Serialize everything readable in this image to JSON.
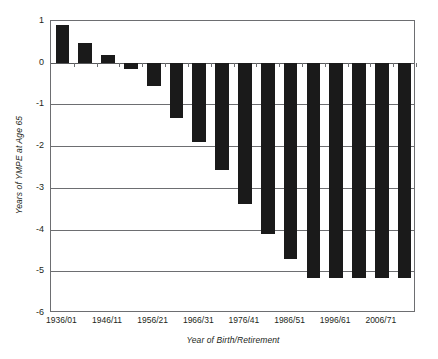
{
  "chart_data": {
    "type": "bar",
    "title": "",
    "xlabel": "Year of Birth/Retirement",
    "ylabel": "Years of YMPE at Age 65",
    "ylim": [
      -6,
      1
    ],
    "yticks": [
      1,
      0,
      -1,
      -2,
      -3,
      -4,
      -5,
      -6
    ],
    "ytick_labels": [
      "1",
      "0",
      "-1",
      "-2",
      "-3",
      "-4",
      "-5",
      "-6"
    ],
    "grid": true,
    "legend": "none",
    "xtick_labels": [
      "1936/01",
      "1946/11",
      "1956/21",
      "1966/31",
      "1976/41",
      "1986/51",
      "1996/61",
      "2006/71"
    ],
    "categories": [
      "1936/01",
      "1941/06",
      "1946/11",
      "1951/16",
      "1956/21",
      "1961/26",
      "1966/31",
      "1971/36",
      "1976/41",
      "1981/46",
      "1986/51",
      "1991/56",
      "1996/61",
      "2001/66",
      "2006/71",
      "2011/76"
    ],
    "values": [
      0.9,
      0.48,
      0.18,
      -0.15,
      -0.55,
      -1.33,
      -1.9,
      -2.58,
      -3.38,
      -4.1,
      -4.7,
      -5.15,
      -5.15,
      -5.15,
      -5.15,
      -5.15
    ],
    "bar_color": "#1a1a1a",
    "axis_color": "#6d6e71"
  },
  "axes": {
    "y_title": "Years of YMPE at Age 65",
    "x_title": "Year of Birth/Retirement"
  }
}
